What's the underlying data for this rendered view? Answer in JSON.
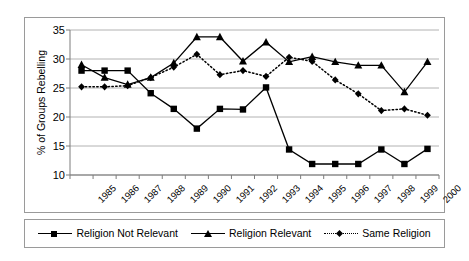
{
  "chart_data": {
    "type": "line",
    "title": "",
    "subtitle": "",
    "xlabel": "",
    "ylabel": "% of Groups Rebelling",
    "ylim": [
      10,
      35
    ],
    "ytick_step": 5,
    "yticks": [
      "35",
      "30",
      "25",
      "20",
      "15",
      "10"
    ],
    "grid": true,
    "grid_axis": "y",
    "legend_position": "bottom",
    "categories": [
      "1985",
      "1986",
      "1987",
      "1988",
      "1989",
      "1990",
      "1991",
      "1992",
      "1993",
      "1994",
      "1995",
      "1996",
      "1997",
      "1998",
      "1999",
      "2000"
    ],
    "series": [
      {
        "name": "Religion Not Relevant",
        "marker": "square",
        "line_style": "solid",
        "color": "#000000",
        "values": [
          28.0,
          28.0,
          28.0,
          24.1,
          21.4,
          18.0,
          21.4,
          21.3,
          25.1,
          14.4,
          11.9,
          11.9,
          11.9,
          14.4,
          11.9,
          14.5
        ]
      },
      {
        "name": "Religion Relevant",
        "marker": "triangle",
        "line_style": "solid",
        "color": "#000000",
        "values": [
          29.0,
          26.8,
          25.6,
          26.8,
          29.3,
          33.8,
          33.8,
          29.6,
          32.9,
          29.5,
          30.4,
          29.5,
          28.9,
          28.9,
          24.3,
          29.5
        ]
      },
      {
        "name": "Same Religion",
        "marker": "diamond",
        "line_style": "dotted",
        "color": "#000000",
        "values": [
          25.2,
          25.2,
          25.4,
          26.8,
          28.6,
          30.8,
          27.3,
          28.0,
          27.0,
          30.3,
          29.6,
          26.4,
          24.0,
          21.1,
          21.4,
          20.3
        ]
      }
    ]
  },
  "legend": {
    "entries": [
      {
        "label": "Religion Not Relevant",
        "marker": "square-marker",
        "style": "solid"
      },
      {
        "label": "Religion Relevant",
        "marker": "triangle-marker",
        "style": "solid"
      },
      {
        "label": "Same Religion",
        "marker": "diamond-marker",
        "style": "dotted"
      }
    ]
  }
}
